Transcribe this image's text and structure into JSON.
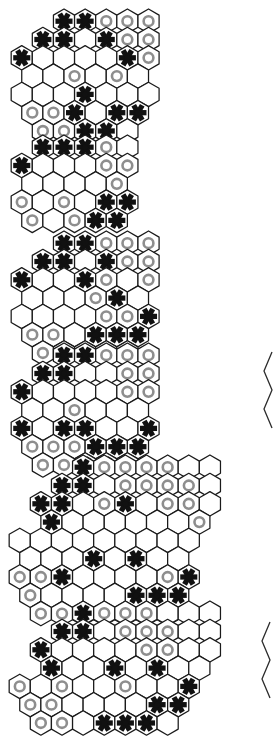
{
  "document": {
    "title": "Hexagonal board diagram sequence",
    "background_color": "#ffffff",
    "width": 277,
    "height": 713,
    "piece_legend": {
      "star": "black-asterisk-piece",
      "ring": "gray-ring-piece",
      "empty": "empty-cell"
    },
    "colors": {
      "cell_fill": "#ffffff",
      "cell_stroke": "#1a1a1a",
      "star_color": "#111111",
      "ring_color": "#8e8e8e"
    }
  },
  "boards": [
    {
      "id": "board-1",
      "name": "hex-board-1",
      "x": 8,
      "y": 6,
      "hex_radius": 12.2,
      "row_lengths": [
        5,
        6,
        7,
        6,
        7,
        6,
        5
      ],
      "rows": [
        {
          "offset": 2.0,
          "cells": [
            "star",
            "star",
            "ring",
            "ring",
            "ring"
          ]
        },
        {
          "offset": 1.0,
          "cells": [
            "star",
            "star",
            "empty",
            "star",
            "ring",
            "ring"
          ]
        },
        {
          "offset": 0.0,
          "cells": [
            "star",
            "empty",
            "empty",
            "empty",
            "empty",
            "star",
            "ring"
          ]
        },
        {
          "offset": 0.5,
          "cells": [
            "empty",
            "empty",
            "ring",
            "empty",
            "ring",
            "empty"
          ]
        },
        {
          "offset": 0.0,
          "cells": [
            "empty",
            "empty",
            "empty",
            "star",
            "empty",
            "empty",
            "empty"
          ]
        },
        {
          "offset": 0.5,
          "cells": [
            "ring",
            "ring",
            "star",
            "empty",
            "star",
            "star"
          ]
        },
        {
          "offset": 1.0,
          "cells": [
            "ring",
            "ring",
            "star",
            "star",
            "empty"
          ]
        }
      ]
    },
    {
      "id": "board-2",
      "name": "hex-board-2",
      "x": 8,
      "y": 132,
      "hex_radius": 12.2,
      "row_lengths": [
        5,
        6,
        5,
        6,
        5
      ],
      "rows": [
        {
          "offset": 1.0,
          "cells": [
            "star",
            "star",
            "star",
            "ring",
            "empty"
          ]
        },
        {
          "offset": 0.0,
          "cells": [
            "star",
            "empty",
            "empty",
            "empty",
            "ring",
            "ring"
          ]
        },
        {
          "offset": 0.5,
          "cells": [
            "empty",
            "empty",
            "empty",
            "empty",
            "ring"
          ]
        },
        {
          "offset": 0.0,
          "cells": [
            "ring",
            "empty",
            "ring",
            "empty",
            "star",
            "star"
          ]
        },
        {
          "offset": 0.5,
          "cells": [
            "ring",
            "empty",
            "ring",
            "star",
            "star"
          ]
        }
      ]
    },
    {
      "id": "board-3",
      "name": "hex-board-3",
      "x": 8,
      "y": 228,
      "hex_radius": 12.2,
      "row_lengths": [
        5,
        6,
        7,
        6,
        7,
        6,
        5
      ],
      "rows": [
        {
          "offset": 2.0,
          "cells": [
            "star",
            "star",
            "ring",
            "ring",
            "ring"
          ]
        },
        {
          "offset": 1.0,
          "cells": [
            "star",
            "star",
            "empty",
            "star",
            "ring",
            "ring"
          ]
        },
        {
          "offset": 0.0,
          "cells": [
            "star",
            "empty",
            "empty",
            "star",
            "ring",
            "empty",
            "ring"
          ]
        },
        {
          "offset": 0.5,
          "cells": [
            "empty",
            "empty",
            "empty",
            "ring",
            "star",
            "empty"
          ]
        },
        {
          "offset": 0.0,
          "cells": [
            "empty",
            "empty",
            "empty",
            "empty",
            "ring",
            "ring",
            "star"
          ]
        },
        {
          "offset": 0.5,
          "cells": [
            "ring",
            "ring",
            "empty",
            "star",
            "star",
            "star"
          ]
        },
        {
          "offset": 1.0,
          "cells": [
            "ring",
            "ring",
            "star",
            "star",
            "empty"
          ]
        }
      ]
    },
    {
      "id": "board-4",
      "name": "hex-board-4",
      "x": 8,
      "y": 340,
      "hex_radius": 12.2,
      "row_lengths": [
        5,
        6,
        7,
        6,
        7,
        6,
        5
      ],
      "rows": [
        {
          "offset": 2.0,
          "cells": [
            "star",
            "star",
            "ring",
            "ring",
            "ring"
          ]
        },
        {
          "offset": 1.0,
          "cells": [
            "star",
            "star",
            "empty",
            "empty",
            "ring",
            "ring"
          ]
        },
        {
          "offset": 0.0,
          "cells": [
            "star",
            "empty",
            "empty",
            "empty",
            "empty",
            "ring",
            "ring"
          ]
        },
        {
          "offset": 0.5,
          "cells": [
            "empty",
            "empty",
            "ring",
            "empty",
            "empty",
            "empty"
          ]
        },
        {
          "offset": 0.0,
          "cells": [
            "star",
            "empty",
            "star",
            "star",
            "empty",
            "empty",
            "star"
          ]
        },
        {
          "offset": 0.5,
          "cells": [
            "ring",
            "ring",
            "ring",
            "star",
            "star",
            "star"
          ]
        },
        {
          "offset": 1.0,
          "cells": [
            "ring",
            "ring",
            "star",
            "star",
            "empty"
          ]
        }
      ]
    },
    {
      "id": "board-5",
      "name": "hex-board-5",
      "x": 6,
      "y": 452,
      "hex_radius": 12.2,
      "row_lengths": [
        7,
        8,
        9,
        8,
        9,
        8,
        9,
        8,
        7
      ],
      "rows": [
        {
          "offset": 3.0,
          "cells": [
            "star",
            "ring",
            "ring",
            "ring",
            "ring",
            "empty",
            "empty"
          ]
        },
        {
          "offset": 2.0,
          "cells": [
            "star",
            "star",
            "empty",
            "ring",
            "ring",
            "ring",
            "ring",
            "empty"
          ]
        },
        {
          "offset": 1.0,
          "cells": [
            "star",
            "star",
            "empty",
            "ring",
            "star",
            "empty",
            "ring",
            "ring",
            "empty"
          ]
        },
        {
          "offset": 1.5,
          "cells": [
            "star",
            "empty",
            "empty",
            "empty",
            "empty",
            "empty",
            "empty",
            "ring"
          ]
        },
        {
          "offset": 0.0,
          "cells": [
            "empty",
            "empty",
            "empty",
            "empty",
            "empty",
            "empty",
            "empty",
            "empty",
            "empty"
          ]
        },
        {
          "offset": 0.5,
          "cells": [
            "empty",
            "empty",
            "empty",
            "star",
            "empty",
            "star",
            "empty",
            "empty"
          ]
        },
        {
          "offset": 0.0,
          "cells": [
            "ring",
            "ring",
            "star",
            "empty",
            "empty",
            "empty",
            "empty",
            "ring",
            "star"
          ]
        },
        {
          "offset": 0.5,
          "cells": [
            "ring",
            "empty",
            "empty",
            "empty",
            "empty",
            "star",
            "star",
            "star"
          ]
        },
        {
          "offset": 1.0,
          "cells": [
            "ring",
            "ring",
            "empty",
            "star",
            "star",
            "star",
            "empty"
          ]
        }
      ]
    },
    {
      "id": "board-6",
      "name": "hex-board-6",
      "x": 6,
      "y": 598,
      "hex_radius": 12.2,
      "row_lengths": [
        7,
        8,
        9,
        8,
        9,
        8,
        7
      ],
      "rows": [
        {
          "offset": 3.0,
          "cells": [
            "star",
            "ring",
            "ring",
            "ring",
            "empty",
            "empty",
            "empty"
          ]
        },
        {
          "offset": 2.0,
          "cells": [
            "star",
            "star",
            "empty",
            "ring",
            "ring",
            "ring",
            "empty",
            "empty"
          ]
        },
        {
          "offset": 1.0,
          "cells": [
            "star",
            "empty",
            "empty",
            "empty",
            "empty",
            "ring",
            "ring",
            "empty",
            "empty"
          ]
        },
        {
          "offset": 1.5,
          "cells": [
            "star",
            "empty",
            "empty",
            "star",
            "empty",
            "star",
            "empty",
            "empty"
          ]
        },
        {
          "offset": 0.0,
          "cells": [
            "ring",
            "empty",
            "ring",
            "empty",
            "empty",
            "ring",
            "empty",
            "empty",
            "star"
          ]
        },
        {
          "offset": 0.5,
          "cells": [
            "ring",
            "ring",
            "empty",
            "empty",
            "empty",
            "empty",
            "star",
            "star"
          ]
        },
        {
          "offset": 1.0,
          "cells": [
            "ring",
            "ring",
            "empty",
            "star",
            "star",
            "star",
            "empty"
          ]
        }
      ]
    }
  ],
  "edge_fragments": [
    {
      "id": "edge-frag-1",
      "name": "hex-edge-fragment-right-upper",
      "x": 262,
      "y": 352,
      "height": 76
    },
    {
      "id": "edge-frag-2",
      "name": "hex-edge-fragment-right-lower",
      "x": 260,
      "y": 622,
      "height": 76
    }
  ]
}
